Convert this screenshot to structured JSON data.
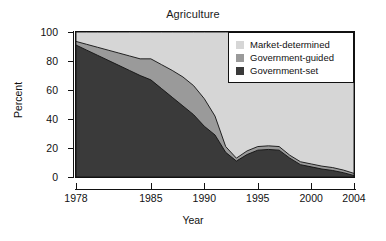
{
  "chart_data": {
    "type": "area",
    "title": "Agriculture",
    "xlabel": "Year",
    "ylabel": "Percent",
    "xlim": [
      1978,
      2004
    ],
    "ylim": [
      0,
      100
    ],
    "grid": false,
    "stacked": true,
    "legend_position": "top-right-inside",
    "xticks": [
      "1978",
      "1985",
      "1990",
      "1995",
      "2000",
      "2004"
    ],
    "xtick_values": [
      1978,
      1985,
      1990,
      1995,
      2000,
      2004
    ],
    "yticks": [
      "0",
      "20",
      "40",
      "60",
      "80",
      "100"
    ],
    "ytick_values": [
      0,
      20,
      40,
      60,
      80,
      100
    ],
    "x": [
      1978,
      1979,
      1980,
      1981,
      1982,
      1983,
      1984,
      1985,
      1986,
      1987,
      1988,
      1989,
      1990,
      1991,
      1992,
      1993,
      1994,
      1995,
      1996,
      1997,
      1998,
      1999,
      2000,
      2001,
      2002,
      2003,
      2004
    ],
    "series": [
      {
        "name": "Government-set",
        "color": "#3a3a3a",
        "values": [
          91.0,
          87.5,
          84.0,
          80.5,
          77.0,
          73.5,
          70.0,
          67.0,
          61.0,
          55.0,
          49.0,
          43.0,
          35.0,
          29.0,
          17.0,
          11.0,
          15.5,
          18.5,
          19.0,
          18.5,
          13.0,
          8.5,
          7.0,
          5.5,
          4.5,
          3.0,
          1.0
        ]
      },
      {
        "name": "Government-guided",
        "color": "#9a9a9a",
        "values": [
          2.5,
          4.0,
          5.5,
          7.0,
          8.5,
          10.0,
          11.5,
          14.5,
          16.5,
          18.5,
          20.0,
          20.0,
          19.0,
          13.0,
          4.0,
          2.0,
          2.5,
          2.5,
          2.5,
          2.5,
          2.0,
          2.0,
          2.0,
          2.0,
          2.0,
          1.8,
          1.5
        ]
      },
      {
        "name": "Market-determined",
        "color": "#d6d6d6",
        "values": [
          6.5,
          8.5,
          10.5,
          12.5,
          14.5,
          16.5,
          18.5,
          18.5,
          22.5,
          26.5,
          31.0,
          37.0,
          46.0,
          58.0,
          79.0,
          87.0,
          82.0,
          79.0,
          78.5,
          79.0,
          85.0,
          89.5,
          91.0,
          92.5,
          93.5,
          95.2,
          97.5
        ]
      }
    ]
  },
  "legend": {
    "items": [
      {
        "label": "Market-determined",
        "color": "#d6d6d6"
      },
      {
        "label": "Government-guided",
        "color": "#9a9a9a"
      },
      {
        "label": "Government-set",
        "color": "#3a3a3a"
      }
    ]
  }
}
